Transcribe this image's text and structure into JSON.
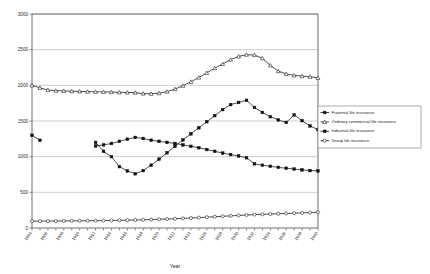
{
  "chart_data": {
    "type": "line",
    "title": "",
    "xlabel": "Year",
    "ylabel": "",
    "xlim": [
      1904,
      1940
    ],
    "ylim": [
      0,
      3000
    ],
    "ytick_step": 500,
    "yticks": [
      0,
      500,
      1000,
      1500,
      2000,
      2500,
      3000
    ],
    "grid": true,
    "legend_position": "right",
    "x": [
      1904,
      1905,
      1906,
      1907,
      1908,
      1909,
      1910,
      1911,
      1912,
      1913,
      1914,
      1915,
      1916,
      1917,
      1918,
      1919,
      1920,
      1921,
      1922,
      1923,
      1924,
      1925,
      1926,
      1927,
      1928,
      1929,
      1930,
      1931,
      1932,
      1933,
      1934,
      1935,
      1936,
      1937,
      1938,
      1939,
      1940
    ],
    "xtick_labels": [
      "1904",
      "1906",
      "1908",
      "1910",
      "1912",
      "1914",
      "1916",
      "1918",
      "1920",
      "1922",
      "1924",
      "1926",
      "1928",
      "1930",
      "1932",
      "1934",
      "1936",
      "1938",
      "1940"
    ],
    "series": [
      {
        "name": "Fraternal life insurance",
        "marker": "filled-square",
        "values": [
          1300,
          1230,
          null,
          null,
          null,
          null,
          null,
          null,
          1150,
          1165,
          1185,
          1215,
          1245,
          1270,
          1255,
          1230,
          1215,
          1200,
          1185,
          1165,
          1145,
          1125,
          1100,
          1075,
          1050,
          1030,
          1010,
          985,
          900,
          880,
          865,
          850,
          838,
          826,
          815,
          805,
          800
        ]
      },
      {
        "name": "Ordinary commercial life insurance",
        "marker": "open-triangle",
        "values": [
          2000,
          1965,
          1935,
          1925,
          1922,
          1918,
          1915,
          1912,
          1910,
          1908,
          1906,
          1902,
          1900,
          1898,
          1885,
          1882,
          1890,
          1912,
          1948,
          1995,
          2050,
          2110,
          2175,
          2240,
          2300,
          2360,
          2405,
          2430,
          2425,
          2380,
          2280,
          2200,
          2160,
          2140,
          2130,
          2120,
          2105
        ]
      },
      {
        "name": "Industrial life insurance",
        "marker": "filled-square",
        "values": [
          null,
          null,
          null,
          null,
          null,
          null,
          null,
          null,
          1200,
          1075,
          1000,
          860,
          800,
          760,
          805,
          880,
          965,
          1055,
          1145,
          1235,
          1320,
          1405,
          1490,
          1575,
          1660,
          1730,
          1760,
          1790,
          1690,
          1620,
          1560,
          1515,
          1480,
          1585,
          1505,
          1430,
          1380
        ]
      },
      {
        "name": "Group life insurance",
        "marker": "open-circle",
        "values": [
          95,
          96,
          97,
          98,
          99,
          100,
          101,
          102,
          103,
          104,
          106,
          108,
          110,
          112,
          115,
          118,
          122,
          126,
          130,
          135,
          140,
          146,
          152,
          158,
          164,
          170,
          176,
          182,
          188,
          192,
          196,
          200,
          204,
          208,
          212,
          216,
          220
        ]
      }
    ]
  },
  "legend": {
    "items": [
      {
        "label": "Fraternal life insurance"
      },
      {
        "label": "Ordinary commercial life insurance"
      },
      {
        "label": "Industrial life insurance"
      },
      {
        "label": "Group life insurance"
      }
    ]
  }
}
